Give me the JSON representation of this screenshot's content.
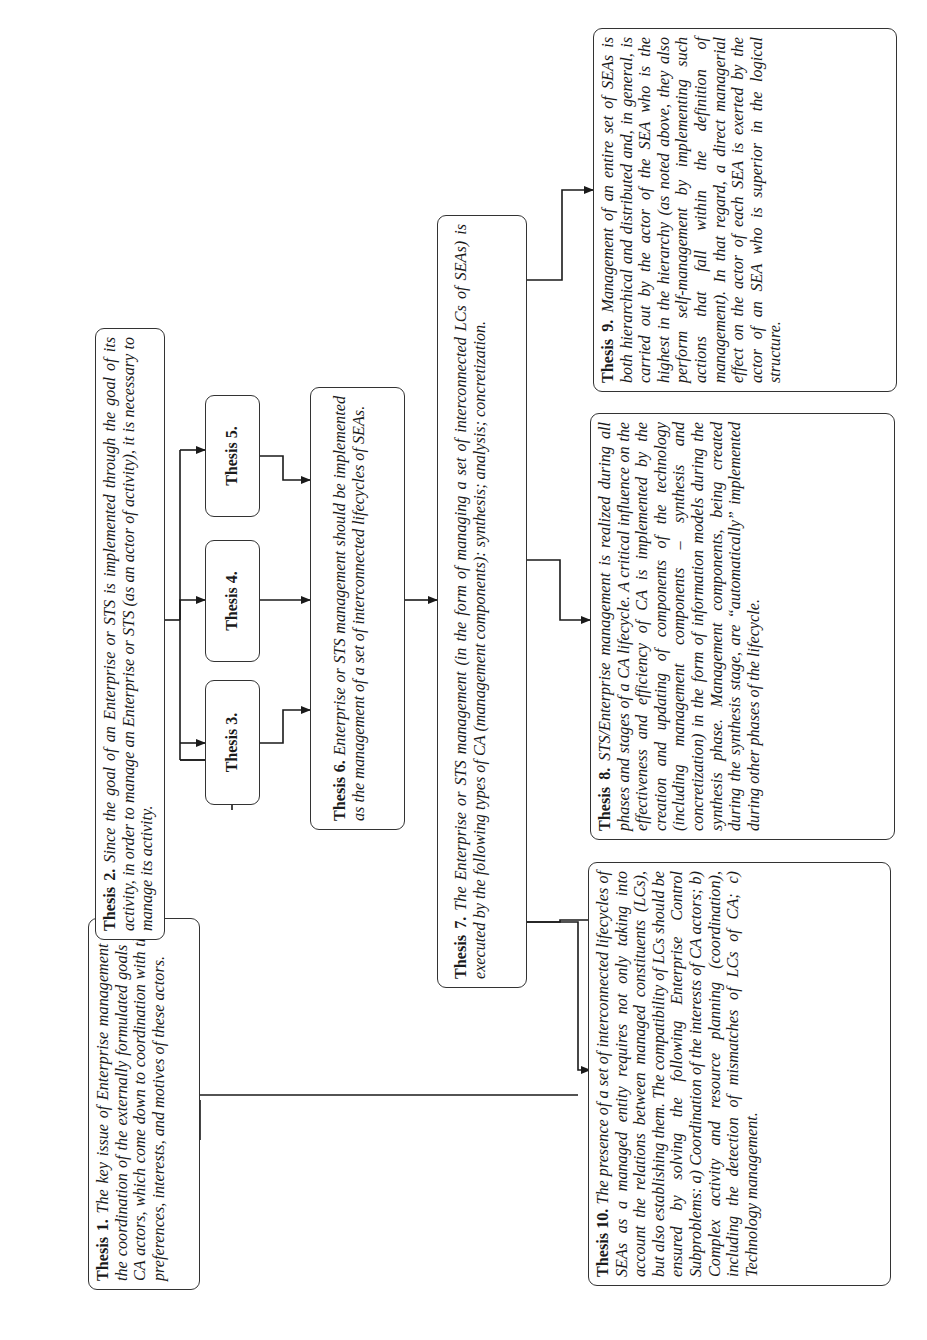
{
  "diagram": {
    "theses": [
      {
        "id": "thesis-1",
        "label": "Thesis 1.",
        "text": "The key issue of Enterprise management is the coordination of the externally formulated goals of CA actors, which come down to coordination with the preferences, interests, and motives of these actors."
      },
      {
        "id": "thesis-2",
        "label": "Thesis 2.",
        "text": "Since the goal of an Enterprise or STS is implemented through the goal of its activity, in order to manage an Enterprise or STS (as an actor of activity), it is necessary to manage its activity."
      },
      {
        "id": "thesis-3",
        "label": "Thesis 3.",
        "text": ""
      },
      {
        "id": "thesis-4",
        "label": "Thesis 4.",
        "text": ""
      },
      {
        "id": "thesis-5",
        "label": "Thesis 5.",
        "text": ""
      },
      {
        "id": "thesis-6",
        "label": "Thesis 6.",
        "text": "Enterprise or STS management should be implemented as the management of a set of interconnected lifecycles of SEAs."
      },
      {
        "id": "thesis-7",
        "label": "Thesis 7.",
        "text": "The Enterprise or STS management (in the form of managing a set of interconnected LCs of SEAs) is executed by the following types of CA (management components): synthesis; analysis; concretization."
      },
      {
        "id": "thesis-8",
        "label": "Thesis 8.",
        "text": "STS/Enterprise management is realized during all phases and stages of a CA lifecycle. A critical influence on the effectiveness and efficiency of CA is implemented by the creation and updating of components of the technology (including management components – synthesis and concretization) in the form of information models during the synthesis phase. Management components, being created during the synthesis stage, are “automatically” implemented during other phases of the lifecycle."
      },
      {
        "id": "thesis-9",
        "label": "Thesis 9.",
        "text": "Management of an entire set of SEAs is both hierarchical and distributed and, in general, is carried out by the actor of the SEA who is the highest in the hierarchy (as noted above, they also perform self-management by implementing such actions that fall within the definition of management). In that regard, a direct managerial effect on the actor of each SEA is exerted by the actor of an SEA who is superior in the logical structure."
      },
      {
        "id": "thesis-10",
        "label": "Thesis 10.",
        "text": "The presence of a set of interconnected lifecycles of SEAs as a managed entity requires not only taking into account the relations between managed constituents (LCs), but also establishing them. The compatibility of LCs should be ensured by solving the following Enterprise Control Subproblems: a) Coordination of the interests of CA actors; b) Complex activity and resource planning (coordination), including the detection of mismatches of LCs of CA; c) Technology management."
      }
    ],
    "connections": [
      {
        "from": "thesis-2",
        "to": "thesis-3"
      },
      {
        "from": "thesis-2",
        "to": "thesis-4"
      },
      {
        "from": "thesis-2",
        "to": "thesis-5"
      },
      {
        "from": "thesis-3",
        "to": "thesis-6"
      },
      {
        "from": "thesis-4",
        "to": "thesis-6"
      },
      {
        "from": "thesis-5",
        "to": "thesis-6"
      },
      {
        "from": "thesis-6",
        "to": "thesis-7"
      },
      {
        "from": "thesis-7",
        "to": "thesis-8"
      },
      {
        "from": "thesis-7",
        "to": "thesis-9"
      },
      {
        "from": "thesis-7",
        "to": "thesis-10"
      },
      {
        "from": "thesis-1",
        "to": "thesis-10"
      }
    ],
    "colors": {
      "line": "#1a1a1a",
      "border": "#333333",
      "background": "#ffffff"
    },
    "orientation": "rotated 90° counter-clockwise"
  }
}
